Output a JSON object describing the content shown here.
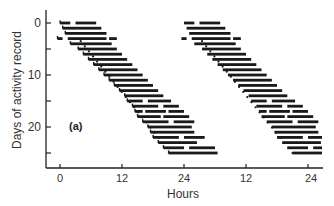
{
  "chart_data": {
    "type": "actogram",
    "title": "",
    "panel_label": "(a)",
    "xlabel": "Hours",
    "ylabel": "Days of activity record",
    "x_ticks": [
      "0",
      "12",
      "24",
      "12",
      "24"
    ],
    "x_tick_hours": [
      0,
      12,
      24,
      36,
      48
    ],
    "y_ticks": [
      "0",
      "",
      "10",
      "",
      "20",
      ""
    ],
    "y_tick_days": [
      0,
      5,
      10,
      15,
      20,
      25
    ],
    "ylim": [
      0,
      26
    ],
    "xlim": [
      -1,
      50
    ],
    "double_plotted": true,
    "grid": false,
    "bar_color": "#1a1a1a",
    "dot_color": "#1a1a1a",
    "activity_bars": [
      {
        "day": 0,
        "segments": [
          [
            0,
            2
          ],
          [
            3,
            7
          ]
        ]
      },
      {
        "day": 1,
        "segments": [
          [
            0.5,
            8
          ]
        ]
      },
      {
        "day": 2,
        "segments": [
          [
            1,
            9
          ]
        ]
      },
      {
        "day": 3,
        "segments": [
          [
            -0.5,
            0.5
          ],
          [
            1.5,
            9
          ],
          [
            9.5,
            11
          ]
        ]
      },
      {
        "day": 4,
        "segments": [
          [
            2,
            10
          ]
        ]
      },
      {
        "day": 5,
        "segments": [
          [
            3.5,
            11
          ]
        ]
      },
      {
        "day": 6,
        "segments": [
          [
            4.5,
            12
          ]
        ]
      },
      {
        "day": 7,
        "segments": [
          [
            5.5,
            13
          ]
        ]
      },
      {
        "day": 8,
        "segments": [
          [
            6.5,
            14
          ]
        ]
      },
      {
        "day": 9,
        "segments": [
          [
            7.5,
            15
          ]
        ]
      },
      {
        "day": 10,
        "segments": [
          [
            8.5,
            16
          ]
        ]
      },
      {
        "day": 11,
        "segments": [
          [
            9.5,
            17
          ]
        ]
      },
      {
        "day": 12,
        "segments": [
          [
            10.5,
            18
          ]
        ]
      },
      {
        "day": 13,
        "segments": [
          [
            11.5,
            19
          ]
        ]
      },
      {
        "day": 14,
        "segments": [
          [
            12.5,
            20
          ]
        ]
      },
      {
        "day": 15,
        "segments": [
          [
            13,
            16
          ],
          [
            17,
            21.5
          ]
        ]
      },
      {
        "day": 16,
        "segments": [
          [
            14,
            19
          ],
          [
            20,
            23
          ]
        ]
      },
      {
        "day": 17,
        "segments": [
          [
            14.5,
            16
          ],
          [
            16.5,
            20.5
          ],
          [
            21,
            24
          ]
        ]
      },
      {
        "day": 18,
        "segments": [
          [
            15,
            19.5
          ],
          [
            20,
            25
          ]
        ]
      },
      {
        "day": 19,
        "segments": [
          [
            16,
            21
          ],
          [
            22,
            26
          ]
        ]
      },
      {
        "day": 20,
        "segments": [
          [
            17,
            25.5
          ]
        ]
      },
      {
        "day": 21,
        "segments": [
          [
            17.5,
            26
          ]
        ]
      },
      {
        "day": 22,
        "segments": [
          [
            18,
            23
          ],
          [
            24,
            28
          ]
        ]
      },
      {
        "day": 23,
        "segments": [
          [
            19,
            26.5
          ]
        ]
      },
      {
        "day": 24,
        "segments": [
          [
            20,
            24
          ],
          [
            25,
            30
          ]
        ]
      },
      {
        "day": 25,
        "segments": [
          [
            21,
            30.5
          ]
        ]
      }
    ],
    "onset_dotted_lines": [
      {
        "from": {
          "hour": 4,
          "day": 3.5
        },
        "to": {
          "hour": 21.5,
          "day": 25
        }
      },
      {
        "from": {
          "hour": 27.5,
          "day": 3.5
        },
        "to": {
          "hour": 45,
          "day": 25
        }
      }
    ]
  },
  "labels": {
    "panel": "(a)",
    "x_axis": "Hours",
    "y_axis": "Days of activity record",
    "x_tick_0": "0",
    "x_tick_1": "12",
    "x_tick_2": "24",
    "x_tick_3": "12",
    "x_tick_4": "24",
    "y_tick_0": "0",
    "y_tick_10": "10",
    "y_tick_20": "20"
  }
}
